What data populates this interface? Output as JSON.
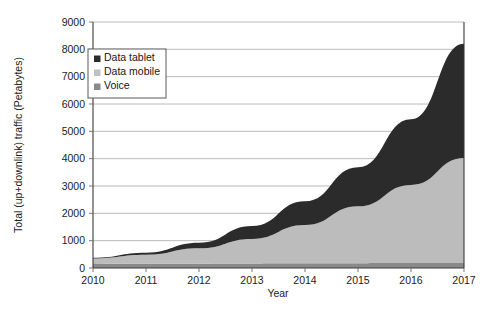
{
  "chart_data": {
    "type": "area",
    "stacked": true,
    "title": "",
    "xlabel": "Year",
    "ylabel": "Total (up+downlink) traffic (Petabytes)",
    "x": [
      2010,
      2011,
      2012,
      2013,
      2014,
      2015,
      2016,
      2017
    ],
    "categories": [
      "2010",
      "2011",
      "2012",
      "2013",
      "2014",
      "2015",
      "2016",
      "2017"
    ],
    "xlim": [
      2010,
      2017
    ],
    "ylim": [
      0,
      9000
    ],
    "yticks": [
      0,
      1000,
      2000,
      3000,
      4000,
      5000,
      6000,
      7000,
      8000,
      9000
    ],
    "ytick_labels": [
      "0",
      "1000",
      "2000",
      "3000",
      "4000",
      "5000",
      "6000",
      "7000",
      "8000",
      "9000"
    ],
    "grid": true,
    "legend_position": "upper-left-inside",
    "stack_order_bottom_to_top": [
      "Voice",
      "Data mobile",
      "Data tablet"
    ],
    "series": [
      {
        "name": "Voice",
        "color": "#8a8a8a",
        "values": [
          150,
          155,
          160,
          165,
          170,
          175,
          180,
          185
        ]
      },
      {
        "name": "Data mobile",
        "color": "#bcbcbc",
        "values": [
          200,
          330,
          560,
          900,
          1400,
          2080,
          2860,
          3840
        ]
      },
      {
        "name": "Data tablet",
        "color": "#2b2b2b",
        "values": [
          25,
          75,
          200,
          470,
          870,
          1430,
          2400,
          4180
        ]
      }
    ],
    "cumulative_totals": [
      375,
      560,
      920,
      1535,
      2440,
      3685,
      5440,
      8205
    ]
  },
  "legend": {
    "items": [
      {
        "label": "Data tablet",
        "swatch": "#2b2b2b"
      },
      {
        "label": "Data mobile",
        "swatch": "#c0c0c0"
      },
      {
        "label": "Voice",
        "swatch": "#8a8a8a"
      }
    ]
  },
  "axes": {
    "y_title": "Total (up+downlink) traffic (Petabytes)",
    "x_title": "Year"
  }
}
